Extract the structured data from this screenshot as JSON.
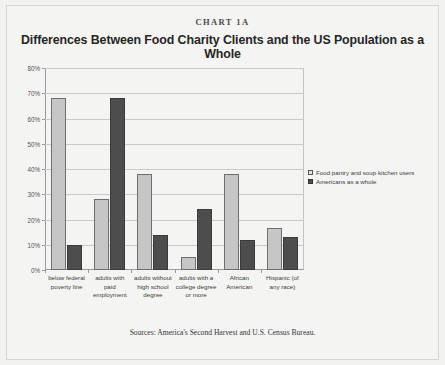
{
  "eyebrow": "CHART 1A",
  "title": "Differences Between Food Charity Clients and the US Population as a Whole",
  "source_note": "Sources: America's Second Harvest and U.S. Census Bureau.",
  "legend": {
    "position": "right",
    "entries": [
      {
        "label": "Food pantry and soup kitchen users",
        "color": "#c6c6c6"
      },
      {
        "label": "Americans as a whole",
        "color": "#4d4d4d"
      }
    ]
  },
  "chart_data": {
    "type": "bar",
    "title": "Differences Between Food Charity Clients and the US Population as a Whole",
    "xlabel": "",
    "ylabel": "",
    "ylim": [
      0,
      80
    ],
    "ytick_labels": [
      "0%",
      "10%",
      "20%",
      "30%",
      "40%",
      "50%",
      "60%",
      "70%",
      "80%"
    ],
    "ytick_values": [
      0,
      10,
      20,
      30,
      40,
      50,
      60,
      70,
      80
    ],
    "grid": true,
    "legend_position": "right",
    "categories": [
      "below federal poverty line",
      "adults with paid employment",
      "adults without high school degree",
      "adults with a college degree or more",
      "African American",
      "Hispanic (of any race)"
    ],
    "series": [
      {
        "name": "Food pantry and soup kitchen users",
        "color": "#c6c6c6",
        "values": [
          68,
          28,
          38,
          5,
          38,
          16.5
        ]
      },
      {
        "name": "Americans as a whole",
        "color": "#4d4d4d",
        "values": [
          10,
          68,
          14,
          24,
          12,
          13
        ]
      }
    ]
  }
}
